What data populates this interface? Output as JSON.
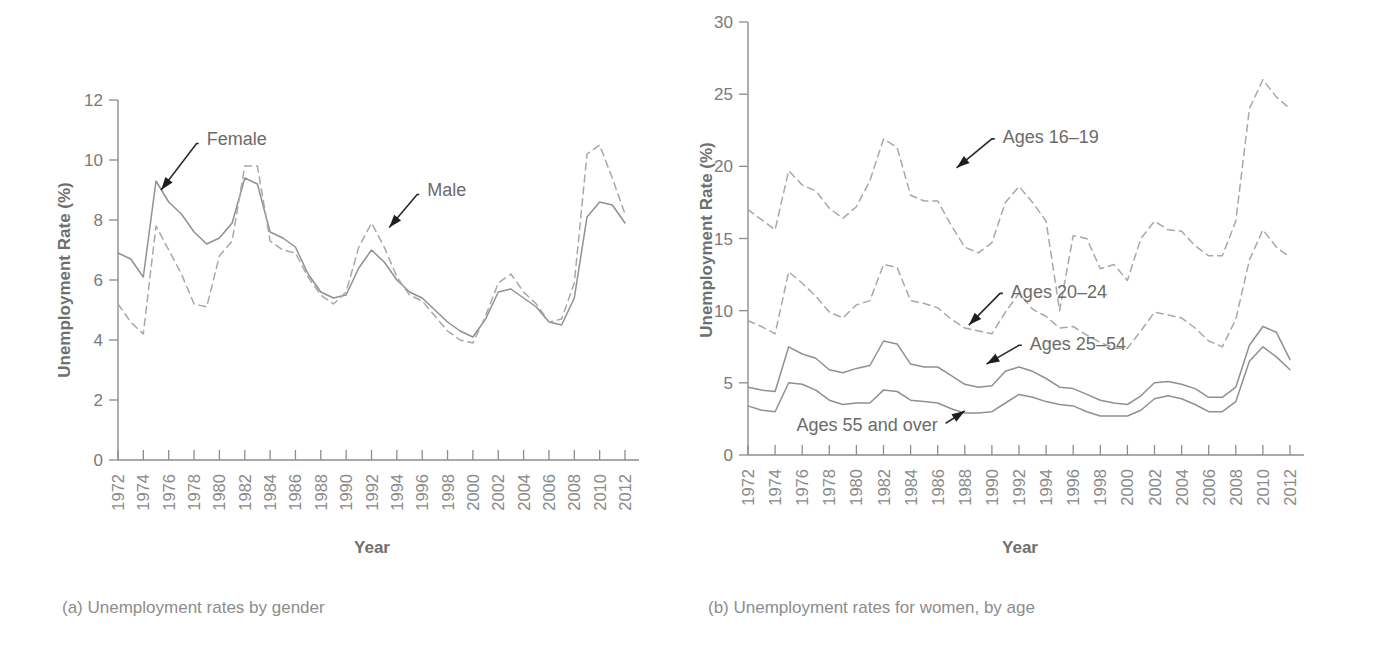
{
  "figure": {
    "panel_a_caption": "(a) Unemployment rates by gender",
    "panel_b_caption": "(b) Unemployment rates for women, by age"
  },
  "chart_data": [
    {
      "id": "panel-a",
      "type": "line",
      "title": "(a) Unemployment rates by gender",
      "xlabel": "Year",
      "ylabel": "Unemployment Rate (%)",
      "xlim": [
        1972,
        2012
      ],
      "ylim": [
        0,
        12
      ],
      "yticks": [
        0,
        2,
        4,
        6,
        8,
        10,
        12
      ],
      "xticks": [
        1972,
        1974,
        1976,
        1978,
        1980,
        1982,
        1984,
        1986,
        1988,
        1990,
        1992,
        1994,
        1996,
        1998,
        2000,
        2002,
        2004,
        2006,
        2008,
        2010,
        2012
      ],
      "grid": false,
      "legend_position": "inline-annotation",
      "x": [
        1972,
        1973,
        1974,
        1975,
        1976,
        1977,
        1978,
        1979,
        1980,
        1981,
        1982,
        1983,
        1984,
        1985,
        1986,
        1987,
        1988,
        1989,
        1990,
        1991,
        1992,
        1993,
        1994,
        1995,
        1996,
        1997,
        1998,
        1999,
        2000,
        2001,
        2002,
        2003,
        2004,
        2005,
        2006,
        2007,
        2008,
        2009,
        2010,
        2011,
        2012
      ],
      "series": [
        {
          "name": "Female",
          "style": "solid",
          "annotation": "Female",
          "values": [
            6.9,
            6.7,
            6.1,
            9.3,
            8.6,
            8.2,
            7.6,
            7.2,
            7.4,
            7.9,
            9.4,
            9.2,
            7.6,
            7.4,
            7.1,
            6.2,
            5.6,
            5.4,
            5.5,
            6.4,
            7.0,
            6.6,
            6.0,
            5.6,
            5.4,
            5.0,
            4.6,
            4.3,
            4.1,
            4.7,
            5.6,
            5.7,
            5.4,
            5.1,
            4.6,
            4.5,
            5.4,
            8.1,
            8.6,
            8.5,
            7.9
          ]
        },
        {
          "name": "Male",
          "style": "dashed",
          "annotation": "Male",
          "values": [
            5.2,
            4.6,
            4.2,
            7.8,
            7.0,
            6.2,
            5.2,
            5.1,
            6.8,
            7.3,
            9.8,
            9.8,
            7.3,
            7.0,
            6.9,
            6.1,
            5.5,
            5.2,
            5.6,
            7.1,
            7.9,
            7.1,
            6.1,
            5.5,
            5.3,
            4.8,
            4.3,
            4.0,
            3.9,
            4.8,
            5.9,
            6.2,
            5.6,
            5.2,
            4.6,
            4.7,
            5.9,
            10.2,
            10.5,
            9.4,
            8.2
          ]
        }
      ]
    },
    {
      "id": "panel-b",
      "type": "line",
      "title": "(b) Unemployment rates for women, by age",
      "xlabel": "Year",
      "ylabel": "Unemployment Rate (%)",
      "xlim": [
        1972,
        2012
      ],
      "ylim": [
        0,
        30
      ],
      "yticks": [
        0,
        5,
        10,
        15,
        20,
        25,
        30
      ],
      "xticks": [
        1972,
        1974,
        1976,
        1978,
        1980,
        1982,
        1984,
        1986,
        1988,
        1990,
        1992,
        1994,
        1996,
        1998,
        2000,
        2002,
        2004,
        2006,
        2008,
        2010,
        2012
      ],
      "grid": false,
      "legend_position": "inline-annotation",
      "x": [
        1972,
        1973,
        1974,
        1975,
        1976,
        1977,
        1978,
        1979,
        1980,
        1981,
        1982,
        1983,
        1984,
        1985,
        1986,
        1987,
        1988,
        1989,
        1990,
        1991,
        1992,
        1993,
        1994,
        1995,
        1996,
        1997,
        1998,
        1999,
        2000,
        2001,
        2002,
        2003,
        2004,
        2005,
        2006,
        2007,
        2008,
        2009,
        2010,
        2011,
        2012
      ],
      "series": [
        {
          "name": "Ages 16-19",
          "style": "dashed",
          "annotation": "Ages 16–19",
          "values": [
            17.0,
            16.3,
            15.6,
            19.7,
            18.7,
            18.3,
            17.1,
            16.4,
            17.2,
            19.0,
            21.9,
            21.3,
            18.0,
            17.6,
            17.6,
            15.9,
            14.4,
            14.0,
            14.7,
            17.5,
            18.6,
            17.5,
            16.2,
            10.0,
            15.2,
            15.0,
            12.9,
            13.2,
            12.1,
            15.0,
            16.2,
            15.6,
            15.5,
            14.5,
            13.8,
            13.8,
            16.2,
            24.0,
            26.0,
            24.8,
            24.0
          ]
        },
        {
          "name": "Ages 20-24",
          "style": "dashed",
          "annotation": "Ages 20–24",
          "values": [
            9.3,
            8.9,
            8.4,
            12.7,
            11.9,
            11.0,
            9.9,
            9.5,
            10.4,
            10.7,
            13.2,
            13.0,
            10.7,
            10.5,
            10.2,
            9.4,
            8.8,
            8.6,
            8.4,
            9.9,
            11.2,
            10.1,
            9.6,
            8.8,
            8.9,
            8.3,
            7.8,
            7.4,
            7.4,
            8.6,
            9.9,
            9.7,
            9.5,
            8.8,
            7.9,
            7.5,
            9.4,
            13.5,
            15.6,
            14.4,
            13.7
          ]
        },
        {
          "name": "Ages 25-54",
          "style": "solid",
          "annotation": "Ages 25–54",
          "values": [
            4.7,
            4.5,
            4.4,
            7.5,
            7.0,
            6.7,
            5.9,
            5.7,
            6.0,
            6.2,
            7.9,
            7.7,
            6.3,
            6.1,
            6.1,
            5.5,
            4.9,
            4.7,
            4.8,
            5.8,
            6.1,
            5.8,
            5.3,
            4.7,
            4.6,
            4.2,
            3.8,
            3.6,
            3.5,
            4.1,
            5.0,
            5.1,
            4.9,
            4.6,
            4.0,
            4.0,
            4.7,
            7.6,
            8.9,
            8.5,
            6.6
          ]
        },
        {
          "name": "Ages 55 and over",
          "style": "solid",
          "annotation": "Ages 55 and over",
          "values": [
            3.4,
            3.1,
            3.0,
            5.0,
            4.9,
            4.5,
            3.8,
            3.5,
            3.6,
            3.6,
            4.5,
            4.4,
            3.8,
            3.7,
            3.6,
            3.2,
            2.9,
            2.9,
            3.0,
            3.6,
            4.2,
            4.0,
            3.7,
            3.5,
            3.4,
            3.0,
            2.7,
            2.7,
            2.7,
            3.1,
            3.9,
            4.1,
            3.9,
            3.5,
            3.0,
            3.0,
            3.7,
            6.5,
            7.5,
            6.8,
            5.9
          ]
        }
      ]
    }
  ]
}
